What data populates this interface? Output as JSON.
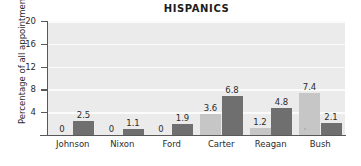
{
  "chart_data": {
    "type": "bar",
    "title": "HISPANICS",
    "xlabel": "",
    "ylabel": "Percentage of all appointments",
    "ylim": [
      0,
      20
    ],
    "yticks": [
      20,
      16,
      12,
      8,
      4
    ],
    "grid": true,
    "legend": "none",
    "categories": [
      "Johnson",
      "Nixon",
      "Ford",
      "Carter",
      "Reagan",
      "Bush"
    ],
    "series": [
      {
        "name": "light",
        "color": "#c6c6c6",
        "values": [
          0,
          0,
          0,
          3.6,
          1.2,
          7.4
        ],
        "labels": [
          "0",
          "0",
          "0",
          "3.6",
          "1.2",
          "7.4"
        ]
      },
      {
        "name": "dark",
        "color": "#6f6f6f",
        "values": [
          2.5,
          1.1,
          1.9,
          6.8,
          4.8,
          2.1
        ],
        "labels": [
          "2.5",
          "1.1",
          "1.9",
          "6.8",
          "4.8",
          "2.1"
        ]
      }
    ]
  },
  "colors": {
    "plot_background": "#ebebeb",
    "gridline": "#fbfbfb",
    "axis": "#58585a",
    "text": "#2b2b2b",
    "bar_light": "#c6c6c6",
    "bar_dark": "#6f6f6f"
  }
}
